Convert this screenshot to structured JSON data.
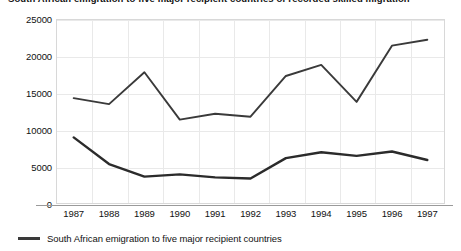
{
  "chart_data": {
    "type": "line",
    "title": "South African emigration to five major recipient countries of recorded skilled migration",
    "xlabel": "",
    "ylabel": "",
    "x": [
      "1987",
      "1988",
      "1989",
      "1990",
      "1991",
      "1992",
      "1993",
      "1994",
      "1995",
      "1996",
      "1997"
    ],
    "ylim": [
      0,
      25000
    ],
    "yticks": [
      "0",
      "5000",
      "10000",
      "15000",
      "20000",
      "25000"
    ],
    "ytick_values": [
      0,
      5000,
      10000,
      15000,
      20000,
      25000
    ],
    "grid": true,
    "legend_position": "bottom-left",
    "series": [
      {
        "name": "Recipient-country recorded immigration from South Africa",
        "values": [
          14300,
          13500,
          17800,
          11400,
          12200,
          11800,
          17300,
          18800,
          13800,
          21400,
          22200
        ],
        "color": "#3a3a3a"
      },
      {
        "name": "South African emigration to five major recipient countries",
        "values": [
          9000,
          5400,
          3700,
          4000,
          3600,
          3450,
          6200,
          7000,
          6500,
          7100,
          5950
        ],
        "color": "#2b2b2b"
      }
    ]
  },
  "legend": {
    "entries": [
      {
        "label": "South African emigration to five major recipient countries",
        "swatch": "line-swatch"
      }
    ]
  }
}
